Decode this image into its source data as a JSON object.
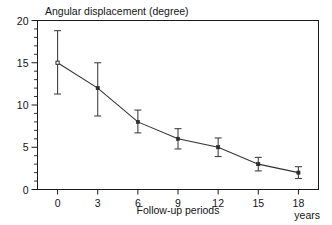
{
  "figure": {
    "title_text": "Angular displacement (degree)",
    "xlabel_text": "Follow-up periods",
    "xunit_text": "years",
    "background_color": "#ffffff",
    "line_color": "#333333",
    "marker_color": "#2b2b2b",
    "axis_color": "#1a1a1a"
  },
  "yaxis": {
    "ticks": [
      "0",
      "5",
      "10",
      "15",
      "20"
    ]
  },
  "xaxis": {
    "ticks": [
      "0",
      "3",
      "6",
      "9",
      "12",
      "15",
      "18"
    ]
  },
  "chart_data": {
    "type": "line",
    "title": "Angular displacement (degree)",
    "xlabel": "Follow-up periods",
    "ylabel": "Angular displacement (degree)",
    "xunit": "years",
    "x": [
      0,
      3,
      6,
      9,
      12,
      15,
      18
    ],
    "xtick_labels": [
      "0",
      "3",
      "6",
      "9",
      "12",
      "15",
      "18"
    ],
    "ytick_labels": [
      "0",
      "5",
      "10",
      "15",
      "20"
    ],
    "values": [
      15,
      12,
      8,
      6,
      5,
      3,
      2
    ],
    "error_upper": [
      3.8,
      3.0,
      1.4,
      1.2,
      1.1,
      0.8,
      0.7
    ],
    "error_lower": [
      3.7,
      3.3,
      1.3,
      1.2,
      1.1,
      0.8,
      0.7
    ],
    "errorbars": true,
    "markers": "square",
    "xlim": [
      -1.5,
      19.5
    ],
    "ylim": [
      0,
      20
    ],
    "y_major_step": 5,
    "y_minor_step": 1,
    "grid": false,
    "legend": null
  }
}
